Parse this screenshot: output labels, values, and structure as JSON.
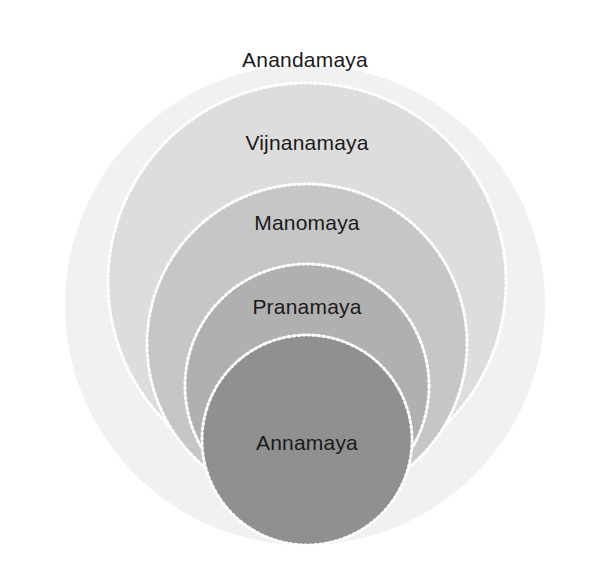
{
  "figure": {
    "kind": "nested-circles-diagram",
    "background_color": "#ffffff",
    "label_color": "#1a1a1a",
    "width": 607,
    "height": 579
  },
  "chart_data": {
    "type": "pie",
    "title": "",
    "subtitle": "",
    "xlabel": "",
    "ylabel": "",
    "legend_position": "none",
    "grid": false,
    "layout": "concentric-nested-circles, bottom-aligned, label at top of each ring",
    "categories": [
      "Anandamaya",
      "Vijnanamaya",
      "Manomaya",
      "Pranamaya",
      "Annamaya"
    ],
    "values": [
      5,
      4,
      3,
      2,
      1
    ],
    "series": [
      {
        "name": "radius_px",
        "values": [
          240,
          199,
          160,
          122,
          105
        ]
      }
    ],
    "annotations": [
      "Anandamaya",
      "Vijnanamaya",
      "Manomaya",
      "Pranamaya",
      "Annamaya"
    ]
  },
  "layers": [
    {
      "id": "anandamaya",
      "label": "Anandamaya",
      "level": 5,
      "fill": "#f1f1f1",
      "stroke": "none",
      "cx": 305,
      "cy": 305,
      "r": 240,
      "label_x": 305,
      "label_y": 60
    },
    {
      "id": "vijnanamaya",
      "label": "Vijnanamaya",
      "level": 4,
      "fill": "#dddddd",
      "stroke": "#ffffff",
      "cx": 307,
      "cy": 282,
      "r": 199,
      "label_x": 307,
      "label_y": 143
    },
    {
      "id": "manomaya",
      "label": "Manomaya",
      "level": 3,
      "fill": "#c6c6c6",
      "stroke": "#ffffff",
      "cx": 307,
      "cy": 344,
      "r": 160,
      "label_x": 307,
      "label_y": 223
    },
    {
      "id": "pranamaya",
      "label": "Pranamaya",
      "level": 2,
      "fill": "#b0b0b0",
      "stroke": "#ffffff",
      "cx": 307,
      "cy": 386,
      "r": 122,
      "label_x": 307,
      "label_y": 307
    },
    {
      "id": "annamaya",
      "label": "Annamaya",
      "level": 1,
      "fill": "#909090",
      "stroke": "#ffffff",
      "cx": 307,
      "cy": 440,
      "r": 105,
      "label_x": 307,
      "label_y": 443
    }
  ]
}
